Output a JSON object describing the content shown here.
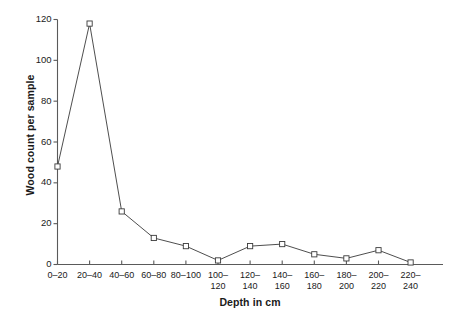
{
  "chart_data": {
    "type": "line",
    "title": "",
    "xlabel": "Depth in cm",
    "ylabel": "Wood count per sample",
    "categories": [
      "0–20",
      "20–40",
      "40–60",
      "60–80",
      "80–100",
      "100–120",
      "120–140",
      "140–160",
      "160–180",
      "180–200",
      "200–220",
      "220–240"
    ],
    "category_lines": [
      [
        "0–20"
      ],
      [
        "20–40"
      ],
      [
        "40–60"
      ],
      [
        "60–80"
      ],
      [
        "80–100"
      ],
      [
        "100–",
        "120"
      ],
      [
        "120–",
        "140"
      ],
      [
        "140–",
        "160"
      ],
      [
        "160–",
        "180"
      ],
      [
        "180–",
        "200"
      ],
      [
        "200–",
        "220"
      ],
      [
        "220–",
        "240"
      ]
    ],
    "values": [
      48,
      118,
      26,
      13,
      9,
      2,
      9,
      10,
      5,
      3,
      7,
      1
    ],
    "ylim": [
      0,
      120
    ],
    "yticks": [
      0,
      20,
      40,
      60,
      80,
      100,
      120
    ],
    "ytick_labels": [
      "0",
      "20",
      "40",
      "60",
      "80",
      "100",
      "120"
    ],
    "grid": false,
    "legend": "none",
    "marker": "open-square",
    "line_color": "#3a3a3a",
    "marker_fill": "#ffffff",
    "marker_edge": "#3a3a3a",
    "axis_color": "#5a5a5a",
    "background": "#ffffff"
  }
}
